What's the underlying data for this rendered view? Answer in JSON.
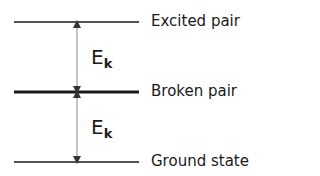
{
  "levels": [
    {
      "label": "Excited pair",
      "y": 22,
      "thickness": 1.5
    },
    {
      "label": "Broken pair",
      "y": 92,
      "thickness": 3
    },
    {
      "label": "Ground state",
      "y": 162,
      "thickness": 1.5
    }
  ],
  "gaps": [
    {
      "symbol": "E",
      "subscript": "k"
    },
    {
      "symbol": "E",
      "subscript": "k"
    }
  ],
  "colors": {
    "line": "#1a1a1a",
    "arrow": "#6e6e6e",
    "text": "#1a1a1a"
  }
}
